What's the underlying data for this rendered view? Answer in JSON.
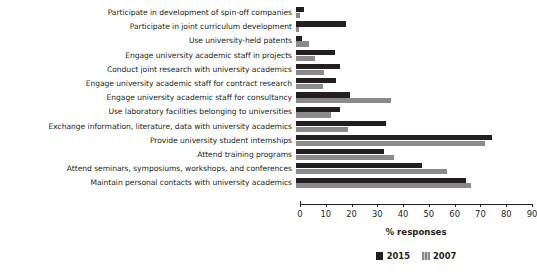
{
  "chart_data": {
    "type": "bar",
    "orientation": "horizontal",
    "title": "",
    "xlabel": "% responses",
    "ylabel": "",
    "xlim": [
      0,
      90
    ],
    "xticks": [
      0,
      10,
      20,
      30,
      40,
      50,
      60,
      70,
      80,
      90
    ],
    "grid": false,
    "legend_position": "bottom",
    "categories": [
      "Participate in development of spin-off companies",
      "Participate in joint curriculum development",
      "Use university-held patents",
      "Engage university academic staff in projects",
      "Conduct joint research with university academics",
      "Engage university academic staff for contract research",
      "Engage university academic staff for consultancy",
      "Use laboratory facilities belonging to universities",
      "Exchange information, literature, data with university academics",
      "Provide university student internships",
      "Attend training programs",
      "Attend seminars, symposiums, workshops, and conferences",
      "Maintain personal contacts with university academics"
    ],
    "series": [
      {
        "name": "2015",
        "color": "#231f20",
        "values": [
          3,
          19.5,
          2.5,
          15,
          17,
          15.5,
          21,
          17,
          35,
          76,
          34,
          49,
          66
        ]
      },
      {
        "name": "2007",
        "color": "#8a8a8c",
        "values": [
          1.5,
          1,
          5,
          7.5,
          11,
          10.5,
          37,
          13.5,
          20,
          73.5,
          38,
          58.5,
          68
        ]
      }
    ]
  },
  "axis": {
    "xlabel": "% responses",
    "tick_labels": [
      "0",
      "10",
      "20",
      "30",
      "40",
      "50",
      "60",
      "70",
      "80",
      "90"
    ]
  },
  "legend": {
    "items": [
      {
        "label": "2015",
        "color": "#231f20"
      },
      {
        "label": "2007",
        "color": "#8a8a8c"
      }
    ]
  }
}
